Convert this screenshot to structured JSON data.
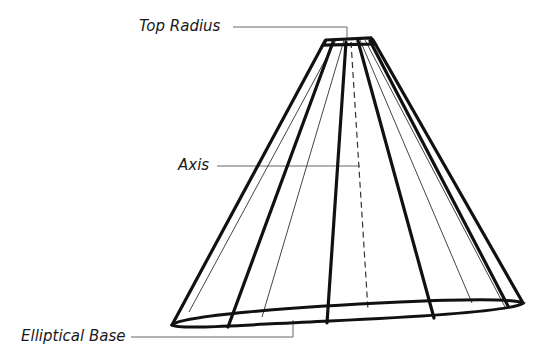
{
  "diagram": {
    "type": "truncated elliptical cone wireframe",
    "labels": {
      "top_radius": "Top Radius",
      "axis": "Axis",
      "elliptical_base": "Elliptical Base"
    },
    "colors": {
      "stroke": "#111111",
      "thin_stroke": "#555555",
      "leader": "#666666",
      "background": "#ffffff"
    }
  }
}
